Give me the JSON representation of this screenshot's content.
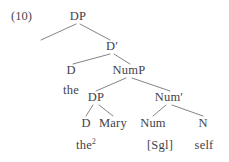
{
  "figure": {
    "example_number": "(10)",
    "type": "x-bar-syntax-tree",
    "ink_color": "#444248",
    "background_color": "#ffffff"
  },
  "nodes": {
    "root_dp": "DP",
    "d_bar": "D′",
    "d_head": "D",
    "nump": "NumP",
    "inner_dp": "DP",
    "num_bar": "Num′",
    "inner_d": "D",
    "num_head": "Num",
    "n_head": "N"
  },
  "terminals": {
    "the_upper": "the",
    "the_lower": "the",
    "the_lower_index": "2",
    "mary": "Mary",
    "sgl_feature": "[Sgl]",
    "self": "self"
  }
}
